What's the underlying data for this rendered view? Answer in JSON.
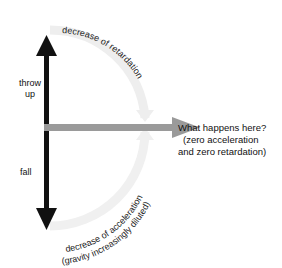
{
  "diagram": {
    "labels": {
      "throw_up": [
        "throw",
        "up"
      ],
      "fall": "fall",
      "question_line1": "What happens here?",
      "question_line2": "(zero acceleration",
      "question_line3": "and  zero  retardation)",
      "upper_arc": "decrease  of  retardation",
      "lower_arc_line1": "decrease of acceleration",
      "lower_arc_line2": "(gravity increasingly diluted)"
    },
    "colors": {
      "vertical_arrow": "#111111",
      "horizontal_arrow": "#9a9a9a",
      "arc": "#eeeeee",
      "text": "#111111"
    }
  }
}
